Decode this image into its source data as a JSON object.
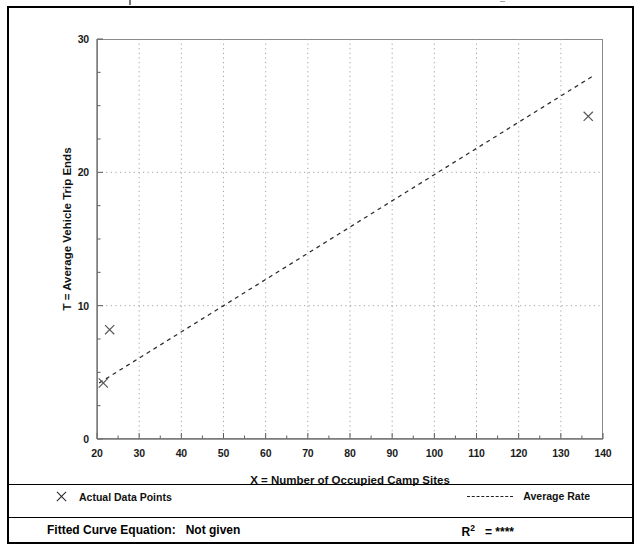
{
  "chart_data": {
    "type": "scatter",
    "title": "",
    "xlabel": "X = Number of Occupied Camp Sites",
    "ylabel": "T = Average Vehicle Trip Ends",
    "xlim": [
      20,
      140
    ],
    "ylim": [
      0,
      30
    ],
    "x_ticks": [
      20,
      30,
      40,
      50,
      60,
      70,
      80,
      90,
      100,
      110,
      120,
      130,
      140
    ],
    "x_minor_step": 5,
    "y_ticks": [
      0,
      10,
      20,
      30
    ],
    "y_minor_step": 2.5,
    "grid": "dotted-vertical-and-horizontal",
    "legend_position": "below-plot",
    "series": [
      {
        "name": "Actual Data Points",
        "type": "scatter",
        "marker": "x",
        "points": [
          {
            "x": 21.5,
            "y": 4.2
          },
          {
            "x": 23.0,
            "y": 8.2
          },
          {
            "x": 136.5,
            "y": 24.2
          }
        ]
      },
      {
        "name": "Average Rate",
        "type": "line",
        "style": "dashed",
        "points": [
          {
            "x": 20.5,
            "y": 4.2
          },
          {
            "x": 137.5,
            "y": 27.2
          }
        ]
      }
    ]
  },
  "axes": {
    "x_title": "X = Number of Occupied Camp Sites",
    "y_title": "T = Average Vehicle Trip Ends",
    "x_tick_labels": [
      "20",
      "30",
      "40",
      "50",
      "60",
      "70",
      "80",
      "90",
      "100",
      "110",
      "120",
      "130",
      "140"
    ],
    "y_tick_labels": [
      "0",
      "10",
      "20",
      "30"
    ]
  },
  "legend": {
    "actual_points_label": "Actual Data Points",
    "average_rate_label": "Average Rate",
    "point_marker_icon": "x-marker-icon",
    "line_sample_icon": "dashed-line-icon"
  },
  "footer": {
    "fitted_curve_label": "Fitted Curve Equation:",
    "fitted_curve_value": "Not given",
    "r_squared_label": "R",
    "r_squared_exponent": "2",
    "r_squared_equals": "= ****"
  },
  "colors": {
    "plot_line": "#222222",
    "frame": "#8a8a8a",
    "grid": "#9a9a9a",
    "text": "#000000",
    "background": "#ffffff"
  }
}
